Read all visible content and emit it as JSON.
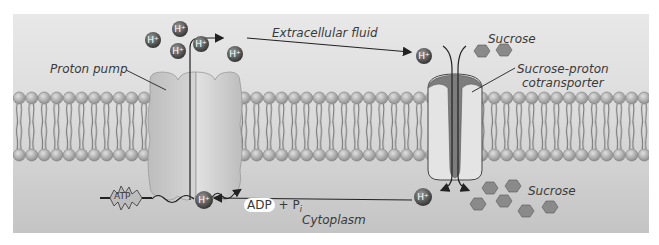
{
  "figure": {
    "labels": {
      "extracellular": "Extracellular fluid",
      "cytoplasm": "Cytoplasm",
      "proton_pump": "Proton pump",
      "sucrose_top": "Sucrose",
      "sucrose_bottom": "Sucrose",
      "cotransporter_line1": "Sucrose-proton",
      "cotransporter_line2": "cotransporter",
      "atp": "ATP",
      "adp": "ADP",
      "plus": "+",
      "pi": "P",
      "pi_sub": "i",
      "proton": "H+"
    },
    "colors": {
      "extracellular_bg": "#e6e6e6",
      "cytoplasm_bg": "#c9c9c9",
      "lipid_head": "#b5b5b5",
      "pump_body": "#cfcfcf",
      "channel_dark": "#7a7a7a",
      "proton": "#4a4a4a",
      "sucrose": "#8e8e8e"
    }
  }
}
